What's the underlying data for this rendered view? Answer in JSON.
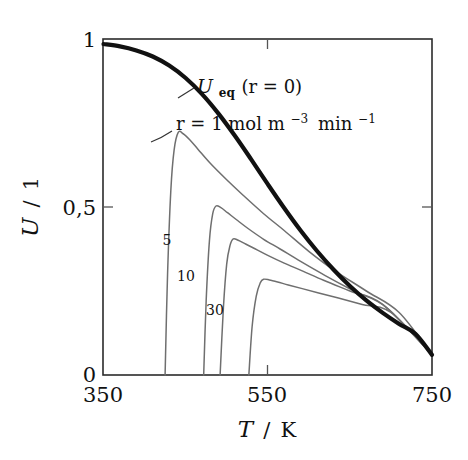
{
  "figure": {
    "background_color": "#ffffff",
    "frame_color": "#2b2b2b"
  },
  "axes": {
    "x": {
      "title": "T / K",
      "title_symbol": "T",
      "title_divider": "/",
      "title_unit": "K",
      "min": 350,
      "max": 750,
      "ticks": [
        350,
        550,
        750
      ],
      "tick_labels": [
        "350",
        "550",
        "750"
      ],
      "minor_tick_at": 550
    },
    "y": {
      "title": "U / 1",
      "title_symbol": "U",
      "title_divider": "/",
      "title_unit": "1",
      "min": 0,
      "max": 1,
      "ticks": [
        0,
        0.5,
        1
      ],
      "tick_labels": [
        "0",
        "0,5",
        "1"
      ],
      "decimal_separator": ","
    }
  },
  "annotations": {
    "equilibrium": {
      "text": "U_eq(r = 0)",
      "symbol": "U",
      "subscript": "eq",
      "paren": "(r = 0)",
      "x": 550,
      "y": 0.875
    },
    "rate": {
      "text": "r = 1 mol m^-3 min^-1",
      "prefix": "r = 1 mol m",
      "exp1": "−3",
      "mid": "min",
      "exp2": "−1",
      "x": 560,
      "y": 0.745
    }
  },
  "chart_data": {
    "type": "line",
    "title": "",
    "xlabel": "T / K",
    "ylabel": "U / 1",
    "xlim": [
      350,
      750
    ],
    "ylim": [
      0,
      1
    ],
    "xticks": [
      350,
      550,
      750
    ],
    "yticks": [
      0,
      0.5,
      1
    ],
    "grid": false,
    "legend": "inline-curve-labels",
    "series": [
      {
        "name": "U_eq (r = 0)",
        "label": "U_eq(r = 0)",
        "r_value": 0,
        "color": "#111111",
        "line_width": 4.2,
        "x": [
          350,
          370,
          390,
          410,
          430,
          450,
          470,
          490,
          510,
          530,
          550,
          570,
          590,
          610,
          630,
          650,
          670,
          690,
          710,
          730,
          750
        ],
        "y": [
          0.985,
          0.978,
          0.966,
          0.948,
          0.921,
          0.884,
          0.836,
          0.778,
          0.712,
          0.641,
          0.568,
          0.497,
          0.43,
          0.369,
          0.314,
          0.265,
          0.222,
          0.185,
          0.152,
          0.122,
          0.06
        ]
      },
      {
        "name": "r = 1",
        "label": "r = 1 mol m−3 min−1",
        "r_value": 1,
        "color": "#6f6f6f",
        "line_width": 1.5,
        "peak_x": 441,
        "peak_y": 0.722,
        "onset_x": 425,
        "x": [
          425,
          428,
          432,
          436,
          441,
          447,
          455,
          465,
          480,
          500,
          520,
          545,
          570,
          600,
          630,
          670,
          710,
          750
        ],
        "y": [
          0.0,
          0.3,
          0.55,
          0.67,
          0.722,
          0.718,
          0.7,
          0.672,
          0.63,
          0.581,
          0.535,
          0.48,
          0.43,
          0.368,
          0.313,
          0.25,
          0.186,
          0.06
        ]
      },
      {
        "name": "r = 5",
        "label": "5",
        "r_value": 5,
        "color": "#6f6f6f",
        "line_width": 1.5,
        "peak_x": 487,
        "peak_y": 0.503,
        "onset_x": 472,
        "label_x": 458,
        "label_y": 0.34,
        "x": [
          472,
          475,
          479,
          483,
          487,
          493,
          501,
          512,
          526,
          545,
          565,
          590,
          620,
          655,
          695,
          750
        ],
        "y": [
          0.0,
          0.22,
          0.4,
          0.48,
          0.503,
          0.498,
          0.483,
          0.462,
          0.436,
          0.404,
          0.375,
          0.338,
          0.296,
          0.25,
          0.2,
          0.06
        ]
      },
      {
        "name": "r = 10",
        "label": "10",
        "r_value": 10,
        "color": "#6f6f6f",
        "line_width": 1.5,
        "peak_x": 508,
        "peak_y": 0.405,
        "onset_x": 492,
        "label_x": 481,
        "label_y": 0.245,
        "x": [
          492,
          496,
          500,
          504,
          508,
          514,
          523,
          535,
          550,
          570,
          592,
          618,
          650,
          690,
          750
        ],
        "y": [
          0.0,
          0.2,
          0.33,
          0.385,
          0.405,
          0.401,
          0.39,
          0.375,
          0.356,
          0.333,
          0.31,
          0.282,
          0.25,
          0.21,
          0.06
        ]
      },
      {
        "name": "r = 30",
        "label": "30",
        "r_value": 30,
        "color": "#6f6f6f",
        "line_width": 1.5,
        "peak_x": 545,
        "peak_y": 0.285,
        "onset_x": 527,
        "label_x": 512,
        "label_y": 0.145,
        "x": [
          527,
          531,
          536,
          541,
          545,
          552,
          562,
          575,
          592,
          612,
          636,
          665,
          700,
          750
        ],
        "y": [
          0.0,
          0.145,
          0.235,
          0.275,
          0.285,
          0.283,
          0.277,
          0.268,
          0.257,
          0.244,
          0.229,
          0.21,
          0.186,
          0.06
        ]
      }
    ],
    "curve_inline_labels": [
      "5",
      "10",
      "30"
    ]
  }
}
